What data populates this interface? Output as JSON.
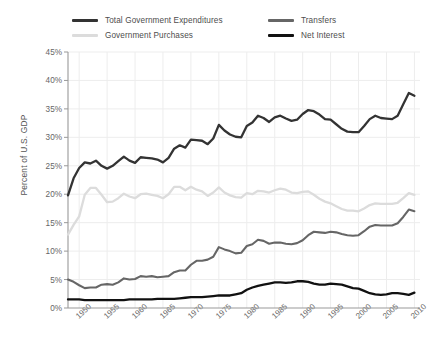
{
  "chart_data": {
    "type": "line",
    "title": "",
    "xlabel": "",
    "ylabel": "Percent of U.S. GDP",
    "xlim": [
      1948,
      2011
    ],
    "ylim": [
      0,
      45
    ],
    "grid": true,
    "legend_position": "top",
    "y_ticks": [
      "0%",
      "5%",
      "10%",
      "15%",
      "20%",
      "25%",
      "30%",
      "35%",
      "40%",
      "45%"
    ],
    "y_tick_values": [
      0,
      5,
      10,
      15,
      20,
      25,
      30,
      35,
      40,
      45
    ],
    "x_ticks": [
      "1950",
      "1955",
      "1960",
      "1965",
      "1970",
      "1975",
      "1980",
      "1985",
      "1990",
      "1995",
      "2000",
      "2005",
      "2010"
    ],
    "x_tick_values": [
      1950,
      1955,
      1960,
      1965,
      1970,
      1975,
      1980,
      1985,
      1990,
      1995,
      2000,
      2005,
      2010
    ],
    "x": [
      1948,
      1949,
      1950,
      1951,
      1952,
      1953,
      1954,
      1955,
      1956,
      1957,
      1958,
      1959,
      1960,
      1961,
      1962,
      1963,
      1964,
      1965,
      1966,
      1967,
      1968,
      1969,
      1970,
      1971,
      1972,
      1973,
      1974,
      1975,
      1976,
      1977,
      1978,
      1979,
      1980,
      1981,
      1982,
      1983,
      1984,
      1985,
      1986,
      1987,
      1988,
      1989,
      1990,
      1991,
      1992,
      1993,
      1994,
      1995,
      1996,
      1997,
      1998,
      1999,
      2000,
      2001,
      2002,
      2003,
      2004,
      2005,
      2006,
      2007,
      2008,
      2009,
      2010
    ],
    "series": [
      {
        "name": "Total Government Expenditures",
        "color": "#333333",
        "width": 2.3,
        "values": [
          19.8,
          22.8,
          24.6,
          25.6,
          25.4,
          25.9,
          25.0,
          24.5,
          25.0,
          25.8,
          26.6,
          25.9,
          25.5,
          26.5,
          26.4,
          26.3,
          26.1,
          25.6,
          26.4,
          28.0,
          28.6,
          28.2,
          29.6,
          29.5,
          29.4,
          28.8,
          29.8,
          32.2,
          31.2,
          30.5,
          30.1,
          30.0,
          32.0,
          32.6,
          33.8,
          33.4,
          32.7,
          33.5,
          33.8,
          33.3,
          32.9,
          33.1,
          34.1,
          34.8,
          34.6,
          34.0,
          33.2,
          33.1,
          32.3,
          31.5,
          31.0,
          30.9,
          30.9,
          32.0,
          33.2,
          33.8,
          33.4,
          33.3,
          33.2,
          33.8,
          35.8,
          37.8,
          37.3
        ]
      },
      {
        "name": "Government Purchases",
        "color": "#dcdcdc",
        "width": 2.3,
        "values": [
          12.9,
          14.6,
          16.1,
          19.9,
          21.1,
          21.1,
          19.9,
          18.6,
          18.7,
          19.3,
          20.1,
          19.6,
          19.3,
          20.0,
          20.1,
          19.9,
          19.7,
          19.3,
          20.0,
          21.3,
          21.3,
          20.7,
          21.3,
          20.8,
          20.5,
          19.7,
          20.3,
          21.2,
          20.3,
          19.8,
          19.5,
          19.4,
          20.2,
          20.0,
          20.6,
          20.5,
          20.3,
          20.7,
          21.0,
          20.8,
          20.3,
          20.2,
          20.4,
          20.5,
          19.9,
          19.2,
          18.7,
          18.4,
          17.9,
          17.4,
          17.1,
          17.1,
          17.0,
          17.5,
          18.1,
          18.4,
          18.3,
          18.3,
          18.3,
          18.5,
          19.3,
          20.2,
          19.9
        ]
      },
      {
        "name": "Transfers",
        "color": "#666666",
        "width": 2.1,
        "values": [
          5.0,
          4.6,
          4.0,
          3.5,
          3.6,
          3.6,
          4.1,
          4.2,
          4.1,
          4.5,
          5.2,
          5.0,
          5.1,
          5.6,
          5.5,
          5.6,
          5.4,
          5.5,
          5.6,
          6.3,
          6.6,
          6.6,
          7.6,
          8.3,
          8.3,
          8.5,
          9.0,
          10.7,
          10.3,
          10.0,
          9.6,
          9.7,
          10.9,
          11.2,
          12.0,
          11.8,
          11.3,
          11.5,
          11.5,
          11.3,
          11.2,
          11.4,
          11.9,
          12.8,
          13.4,
          13.3,
          13.2,
          13.4,
          13.3,
          13.0,
          12.8,
          12.7,
          12.8,
          13.5,
          14.3,
          14.6,
          14.5,
          14.5,
          14.5,
          14.9,
          16.0,
          17.3,
          17.0
        ]
      },
      {
        "name": "Net Interest",
        "color": "#111111",
        "width": 2.3,
        "values": [
          1.5,
          1.5,
          1.5,
          1.4,
          1.4,
          1.4,
          1.4,
          1.4,
          1.4,
          1.4,
          1.4,
          1.5,
          1.5,
          1.5,
          1.5,
          1.5,
          1.6,
          1.6,
          1.6,
          1.6,
          1.7,
          1.8,
          1.9,
          1.9,
          1.9,
          2.0,
          2.1,
          2.2,
          2.2,
          2.2,
          2.4,
          2.6,
          3.2,
          3.6,
          3.9,
          4.1,
          4.3,
          4.5,
          4.5,
          4.4,
          4.5,
          4.7,
          4.7,
          4.6,
          4.3,
          4.1,
          4.1,
          4.3,
          4.2,
          4.1,
          3.8,
          3.5,
          3.4,
          3.0,
          2.6,
          2.4,
          2.3,
          2.4,
          2.6,
          2.6,
          2.5,
          2.3,
          2.7
        ]
      }
    ]
  },
  "legend": {
    "items": [
      {
        "label": "Total Government Expenditures",
        "color": "#333333"
      },
      {
        "label": "Government Purchases",
        "color": "#dcdcdc"
      },
      {
        "label": "Transfers",
        "color": "#666666"
      },
      {
        "label": "Net Interest",
        "color": "#111111"
      }
    ]
  },
  "axes": {
    "y_title": "Percent of U.S. GDP",
    "axis_color": "#999999",
    "grid_color": "#ededed",
    "tick_text_color": "#666666"
  }
}
